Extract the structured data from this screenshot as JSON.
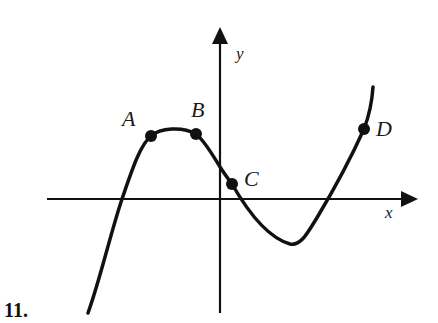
{
  "problem": {
    "number": "11."
  },
  "axes": {
    "x_label": "x",
    "y_label": "y"
  },
  "points": [
    {
      "id": "A",
      "label": "A"
    },
    {
      "id": "B",
      "label": "B"
    },
    {
      "id": "C",
      "label": "C"
    },
    {
      "id": "D",
      "label": "D"
    }
  ],
  "colors": {
    "ink": "#111111",
    "background": "#ffffff"
  }
}
